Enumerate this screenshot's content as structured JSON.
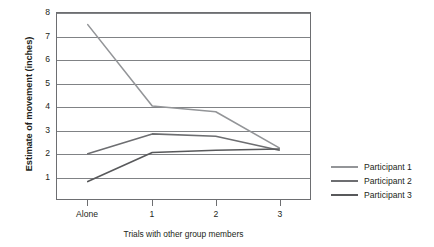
{
  "chart_data": {
    "type": "line",
    "title": "",
    "xlabel": "Trials with other group members",
    "ylabel": "Estimate of movement (inches)",
    "categories": [
      "Alone",
      "1",
      "2",
      "3"
    ],
    "ylim": [
      0,
      8
    ],
    "yticks": [
      8,
      7,
      6,
      5,
      4,
      3,
      2,
      1
    ],
    "grid": "horizontal",
    "legend_position": "right",
    "series": [
      {
        "name": "Participant 1",
        "values": [
          7.5,
          4.0,
          3.75,
          2.2
        ],
        "color": "#939598"
      },
      {
        "name": "Participant 2",
        "values": [
          1.95,
          2.8,
          2.7,
          2.1
        ],
        "color": "#6d6e71"
      },
      {
        "name": "Participant 3",
        "values": [
          0.75,
          2.0,
          2.1,
          2.15
        ],
        "color": "#58595b"
      }
    ]
  },
  "axes": {
    "y_title": "Estimate of movement (inches)",
    "x_title": "Trials with other group members",
    "y_tick_labels": [
      "8",
      "7",
      "6",
      "5",
      "4",
      "3",
      "2",
      "1"
    ],
    "x_tick_labels": [
      "Alone",
      "1",
      "2",
      "3"
    ]
  },
  "legend": {
    "entries": [
      {
        "label": "Participant 1"
      },
      {
        "label": "Participant 2"
      },
      {
        "label": "Participant 3"
      }
    ]
  },
  "colors": {
    "series_1": "#939598",
    "series_2": "#6d6e71",
    "series_3": "#58595b",
    "frame": "#6d6e71",
    "gridline": "#808285",
    "text": "#231f20",
    "background": "#ffffff"
  }
}
